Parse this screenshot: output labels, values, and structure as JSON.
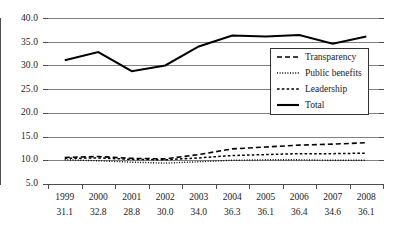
{
  "chart_data": {
    "type": "line",
    "title": "",
    "xlabel": "",
    "ylabel": "",
    "ylim": [
      5.0,
      40.0
    ],
    "ytick_labels": [
      "40.0",
      "35.0",
      "30.0",
      "25.0",
      "20.0",
      "15.0",
      "10.0",
      "5.0"
    ],
    "yticks": [
      40.0,
      35.0,
      30.0,
      25.0,
      20.0,
      15.0,
      10.0,
      5.0
    ],
    "grid": true,
    "legend_position": "center-right",
    "categories": [
      "1999",
      "2000",
      "2001",
      "2002",
      "2003",
      "2004",
      "2005",
      "2006",
      "2007",
      "2008"
    ],
    "series": [
      {
        "name": "Transparency",
        "style": "long-dashed",
        "color": "#000000",
        "values": [
          10.6,
          10.8,
          10.4,
          10.3,
          11.2,
          12.4,
          12.8,
          13.2,
          13.4,
          13.7
        ]
      },
      {
        "name": "Public benefits",
        "style": "dotted",
        "color": "#000000",
        "values": [
          10.1,
          9.9,
          9.6,
          9.4,
          9.7,
          10.0,
          10.1,
          10.1,
          10.0,
          10.0
        ]
      },
      {
        "name": "Leadership",
        "style": "short-dashed",
        "color": "#000000",
        "values": [
          10.4,
          10.5,
          10.2,
          10.1,
          10.5,
          11.0,
          11.2,
          11.4,
          11.4,
          11.5
        ]
      },
      {
        "name": "Total",
        "style": "solid",
        "color": "#000000",
        "values": [
          31.1,
          32.8,
          28.8,
          30.0,
          34.0,
          36.3,
          36.1,
          36.4,
          34.6,
          36.1
        ]
      }
    ],
    "value_row_label": "Total",
    "value_row": [
      "31.1",
      "32.8",
      "28.8",
      "30.0",
      "34.0",
      "36.3",
      "36.1",
      "36.4",
      "34.6",
      "36.1"
    ]
  },
  "legend": {
    "items": [
      {
        "label": "Transparency",
        "style": "long-dashed"
      },
      {
        "label": "Public benefits",
        "style": "dotted"
      },
      {
        "label": "Leadership",
        "style": "short-dashed"
      },
      {
        "label": "Total",
        "style": "solid"
      }
    ]
  },
  "colors": {
    "line": "#000000",
    "grid": "#808080",
    "axis": "#4d4d4d",
    "text": "#1a1a1a",
    "background": "#ffffff"
  }
}
